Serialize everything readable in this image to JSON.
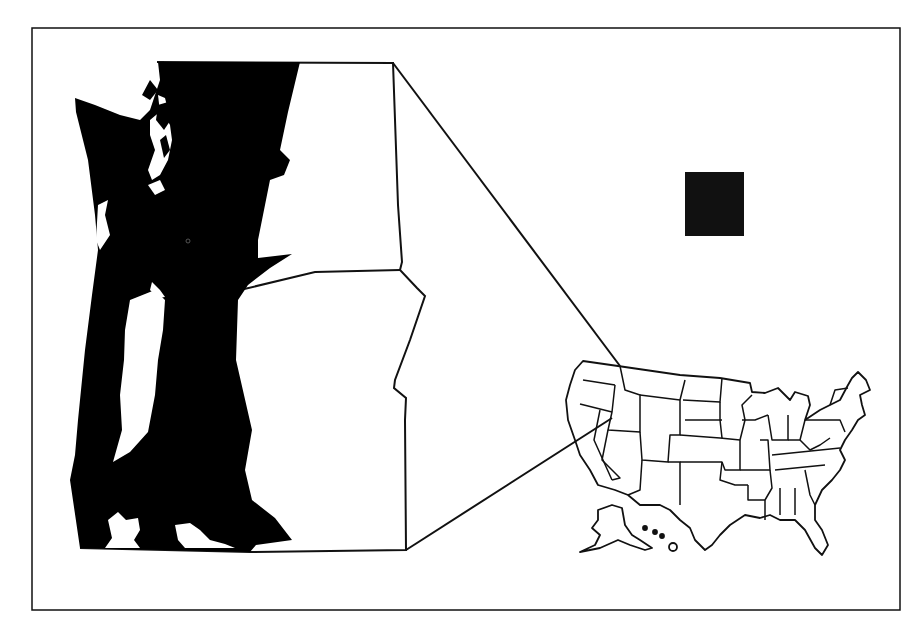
{
  "figure": {
    "type": "locator-map",
    "colors": {
      "background": "#ffffff",
      "land_fill": "#000000",
      "water_fill": "#ffffff",
      "outline": "#111111",
      "legend_square": "#111111"
    },
    "text_labels": []
  },
  "inset": {
    "region": "Puget Sound / Western Washington",
    "fill": "study-area-shaded-black"
  },
  "locator": {
    "region": "United States",
    "connector_lines": 2
  },
  "legend": {
    "symbol": "black-square",
    "label": ""
  }
}
